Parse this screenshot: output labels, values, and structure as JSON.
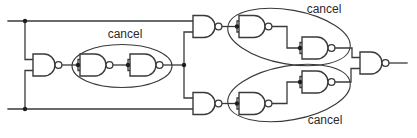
{
  "diagram": {
    "kind": "logic-circuit",
    "labels": {
      "cancel_left": "cancel",
      "cancel_top_right": "cancel",
      "cancel_bottom_right": "cancel"
    },
    "colors": {
      "line": "#3a3a3a",
      "dot": "#1e1e1e",
      "label": "#2a2a2a",
      "background": "#ffffff"
    },
    "components": [
      {
        "name": "input-nand-gate",
        "type": "NAND"
      },
      {
        "name": "left-inverter-1",
        "type": "NAND-as-inverter"
      },
      {
        "name": "left-inverter-2",
        "type": "NAND-as-inverter"
      },
      {
        "name": "top-nand-gate",
        "type": "NAND"
      },
      {
        "name": "top-inverter-1",
        "type": "NAND-as-inverter"
      },
      {
        "name": "top-inverter-2",
        "type": "NAND-as-inverter"
      },
      {
        "name": "bottom-nand-gate",
        "type": "NAND"
      },
      {
        "name": "bottom-inverter-1",
        "type": "NAND-as-inverter"
      },
      {
        "name": "bottom-inverter-2",
        "type": "NAND-as-inverter"
      },
      {
        "name": "output-nand-gate",
        "type": "NAND"
      }
    ]
  }
}
